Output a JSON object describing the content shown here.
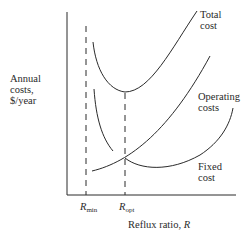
{
  "diagram": {
    "type": "cost-vs-reflux-ratio",
    "y_axis_label": [
      "Annual",
      "costs,",
      "$/year"
    ],
    "x_axis_label": "Reflux ratio, ",
    "x_axis_symbol": "R",
    "markers": [
      {
        "symbol": "R",
        "subscript": "min"
      },
      {
        "symbol": "R",
        "subscript": "opt"
      }
    ],
    "curves": [
      {
        "name": "Total cost",
        "label_lines": [
          "Total",
          "cost"
        ]
      },
      {
        "name": "Operating costs",
        "label_lines": [
          "Operating",
          "costs"
        ]
      },
      {
        "name": "Fixed cost",
        "label_lines": [
          "Fixed",
          "cost"
        ]
      }
    ],
    "line_color": "#2a2a2a"
  }
}
